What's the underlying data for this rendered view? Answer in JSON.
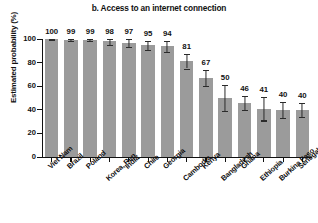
{
  "chart_data": {
    "type": "bar",
    "title": "b. Access to an internet connection",
    "xlabel": "",
    "ylabel": "Estimated probability (%)",
    "ylim": [
      0,
      100
    ],
    "yticks": [
      0,
      20,
      40,
      60,
      80,
      100
    ],
    "grid": false,
    "legend": null,
    "bar_color": "#9b9b9b",
    "error_bar_color": "#2b2b2b",
    "categories": [
      "Viet Nam",
      "Brazil",
      "Poland",
      "Korea, Rep.",
      "India",
      "Chile",
      "Georgia",
      "Cambodia",
      "Kenya",
      "Bangladesh",
      "Ghana",
      "Ethiopia",
      "Burkina Faso",
      "Senegal"
    ],
    "values": [
      100,
      99,
      99,
      98,
      97,
      95,
      94,
      81,
      67,
      50,
      46,
      41,
      40,
      40
    ],
    "value_labels": [
      "100",
      "99",
      "99",
      "98",
      "97",
      "95",
      "94",
      "81",
      "67",
      "50",
      "46",
      "41",
      "40",
      "40"
    ],
    "error_low": [
      99,
      98,
      98,
      95,
      93,
      91,
      89,
      75,
      60,
      39,
      40,
      31,
      33,
      34
    ],
    "error_high": [
      100,
      100,
      100,
      100,
      100,
      98,
      98,
      87,
      74,
      61,
      52,
      51,
      47,
      46
    ],
    "label_rows": [
      0,
      0,
      0,
      1,
      0,
      0,
      0,
      1,
      0,
      1,
      0,
      1,
      1,
      0
    ]
  }
}
